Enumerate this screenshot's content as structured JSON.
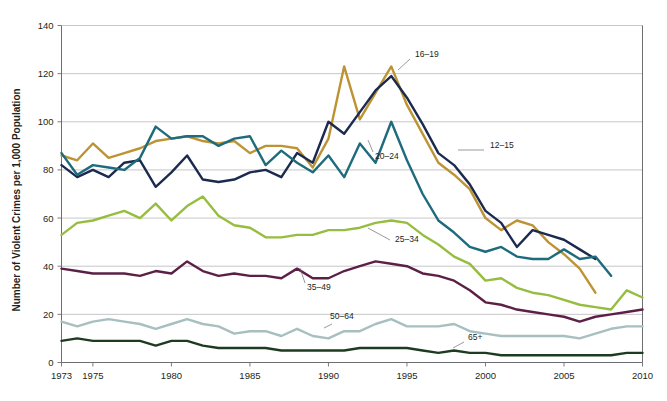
{
  "chart_data": {
    "type": "line",
    "title": "",
    "subtitle": "",
    "xlabel": "",
    "ylabel": "Number of Violent Crimes per 1,000 Population",
    "xlim": [
      1973,
      2010
    ],
    "ylim": [
      0,
      140
    ],
    "y_ticks": [
      0,
      20,
      40,
      60,
      80,
      100,
      120,
      140
    ],
    "x_ticks": [
      1973,
      1975,
      1980,
      1985,
      1990,
      1995,
      2000,
      2005,
      2010
    ],
    "x_tick_labels": [
      "1973",
      "1975",
      "1980",
      "1985",
      "1990",
      "1995",
      "2000",
      "2005",
      "2010"
    ],
    "y_tick_labels": [
      "0",
      "20",
      "40",
      "60",
      "80",
      "100",
      "120",
      "140"
    ],
    "grid": "horizontal",
    "legend_position": "inline-annotations",
    "x": [
      1973,
      1974,
      1975,
      1976,
      1977,
      1978,
      1979,
      1980,
      1981,
      1982,
      1983,
      1984,
      1985,
      1986,
      1987,
      1988,
      1989,
      1990,
      1991,
      1992,
      1993,
      1994,
      1995,
      1996,
      1997,
      1998,
      1999,
      2000,
      2001,
      2002,
      2003,
      2004,
      2005,
      2006,
      2007,
      2008,
      2009,
      2010
    ],
    "series": [
      {
        "name": "12-15",
        "label": "12–15",
        "color": "#bd9334",
        "label_x": 490,
        "label_y": 148,
        "leader": "M 458 150 L 484 150",
        "values": [
          86,
          84,
          91,
          85,
          87,
          89,
          92,
          93,
          94,
          92,
          91,
          92,
          87,
          90,
          90,
          89,
          81,
          93,
          123,
          101,
          112,
          123,
          107,
          95,
          83,
          78,
          72,
          60,
          55,
          59,
          57,
          50,
          45,
          39,
          29,
          null,
          null,
          null
        ]
      },
      {
        "name": "16-19",
        "label": "16–19",
        "color": "#1b2a4e",
        "label_x": 415,
        "label_y": 57,
        "leader": "M 398 70 L 410 59",
        "values": [
          82,
          77,
          80,
          77,
          83,
          84,
          73,
          79,
          86,
          76,
          75,
          76,
          79,
          80,
          77,
          87,
          83,
          100,
          95,
          104,
          113,
          119,
          110,
          99,
          87,
          82,
          74,
          63,
          58,
          48,
          55,
          53,
          51,
          47,
          43,
          null,
          null,
          null
        ]
      },
      {
        "name": "20-24",
        "label": "20–24",
        "color": "#1d6b7d",
        "label_x": 375,
        "label_y": 159,
        "leader": "M 368 140 L 373 152",
        "values": [
          87,
          78,
          82,
          81,
          80,
          85,
          98,
          93,
          94,
          94,
          90,
          93,
          94,
          82,
          88,
          83,
          79,
          86,
          77,
          91,
          83,
          100,
          84,
          70,
          59,
          54,
          48,
          46,
          48,
          44,
          43,
          43,
          47,
          43,
          44,
          36,
          null,
          null
        ]
      },
      {
        "name": "25-34",
        "label": "25–34",
        "color": "#96bd3f",
        "label_x": 395,
        "label_y": 242,
        "leader": "M 368 228 L 390 240",
        "values": [
          53,
          58,
          59,
          61,
          63,
          60,
          66,
          59,
          65,
          69,
          61,
          57,
          56,
          52,
          52,
          53,
          53,
          55,
          55,
          56,
          58,
          59,
          58,
          53,
          49,
          44,
          41,
          34,
          35,
          31,
          29,
          28,
          26,
          24,
          23,
          22,
          30,
          27
        ]
      },
      {
        "name": "35-49",
        "label": "35–49",
        "color": "#5c2046",
        "label_x": 307,
        "label_y": 290,
        "leader": "M 300 268 L 305 283",
        "values": [
          39,
          38,
          37,
          37,
          37,
          36,
          38,
          37,
          42,
          38,
          36,
          37,
          36,
          36,
          35,
          39,
          35,
          35,
          38,
          40,
          42,
          41,
          40,
          37,
          36,
          34,
          30,
          25,
          24,
          22,
          21,
          20,
          19,
          17,
          19,
          20,
          21,
          22
        ]
      },
      {
        "name": "50-64",
        "label": "50–64",
        "color": "#a8bfc0",
        "label_x": 330,
        "label_y": 319,
        "leader": "M 324 328 L 332 324",
        "values": [
          17,
          15,
          17,
          18,
          17,
          16,
          14,
          16,
          18,
          16,
          15,
          12,
          13,
          13,
          11,
          14,
          11,
          10,
          13,
          13,
          16,
          18,
          15,
          15,
          15,
          16,
          13,
          12,
          11,
          11,
          11,
          11,
          11,
          10,
          12,
          14,
          15,
          15
        ]
      },
      {
        "name": "65+",
        "label": "65+",
        "color": "#1d3b20",
        "label_x": 468,
        "label_y": 340,
        "leader": "M 453 348 L 464 342",
        "values": [
          9,
          10,
          9,
          9,
          9,
          9,
          7,
          9,
          9,
          7,
          6,
          6,
          6,
          6,
          5,
          5,
          5,
          5,
          5,
          6,
          6,
          6,
          6,
          5,
          4,
          5,
          4,
          4,
          3,
          3,
          3,
          3,
          3,
          3,
          3,
          3,
          4,
          4
        ]
      }
    ]
  }
}
